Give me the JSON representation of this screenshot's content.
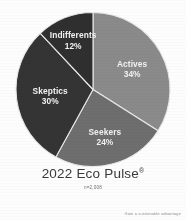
{
  "chart_data": {
    "type": "pie",
    "title": "2022 Eco Pulse",
    "title_superscript": "®",
    "subtitle": "n=2,008",
    "categories": [
      "Actives",
      "Seekers",
      "Skeptics",
      "Indifferents"
    ],
    "values": [
      34,
      24,
      30,
      12
    ],
    "value_suffix": "%",
    "labels": [
      {
        "name": "Actives",
        "value": 34,
        "value_text": "34%",
        "color": "#8a8a8a"
      },
      {
        "name": "Seekers",
        "value": 24,
        "value_text": "24%",
        "color": "#6e6e6e"
      },
      {
        "name": "Skeptics",
        "value": 30,
        "value_text": "30%",
        "color": "#343434"
      },
      {
        "name": "Indifferents",
        "value": 12,
        "value_text": "12%",
        "color": "#2f2f2f"
      }
    ],
    "start_angle_deg": 0,
    "direction": "clockwise",
    "legend": "none",
    "grid": false,
    "label_placement": "inside-slice",
    "total": 100
  },
  "footer": {
    "tagline": "Gain a sustainable advantage"
  },
  "theme": {
    "background": "#fdfdfd",
    "label_text_color": "#f2f2f2",
    "title_color": "#3b3b3b",
    "subtitle_color": "#6f6f6f",
    "tagline_color": "#8d8d8d",
    "slice_divider_color": "#e8e8e8"
  }
}
